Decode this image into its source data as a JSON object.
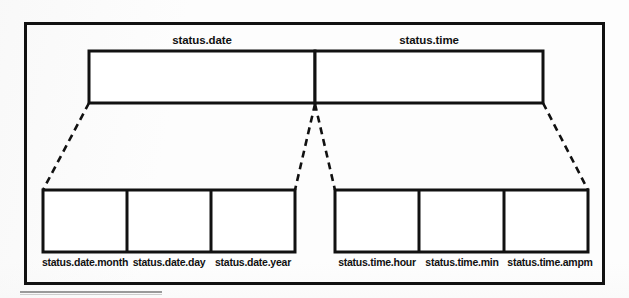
{
  "diagram": {
    "type": "structure-decomposition",
    "title_top_level": [
      {
        "id": "status-date",
        "label": "status.date"
      },
      {
        "id": "status-time",
        "label": "status.time"
      }
    ],
    "leaf_fields": [
      {
        "id": "status-date-month",
        "label": "status.date.month",
        "parent": "status.date"
      },
      {
        "id": "status-date-day",
        "label": "status.date.day",
        "parent": "status.date"
      },
      {
        "id": "status-date-year",
        "label": "status.date.year",
        "parent": "status.date"
      },
      {
        "id": "status-time-hour",
        "label": "status.time.hour",
        "parent": "status.time"
      },
      {
        "id": "status-time-min",
        "label": "status.time.min",
        "parent": "status.time"
      },
      {
        "id": "status-time-ampm",
        "label": "status.time.ampm",
        "parent": "status.time"
      }
    ],
    "colors": {
      "stroke": "#111111",
      "fill": "#ffffff",
      "background": "#fdfdfd",
      "scan_rule": "#9a9a9a"
    },
    "connector_style": "dashed"
  }
}
